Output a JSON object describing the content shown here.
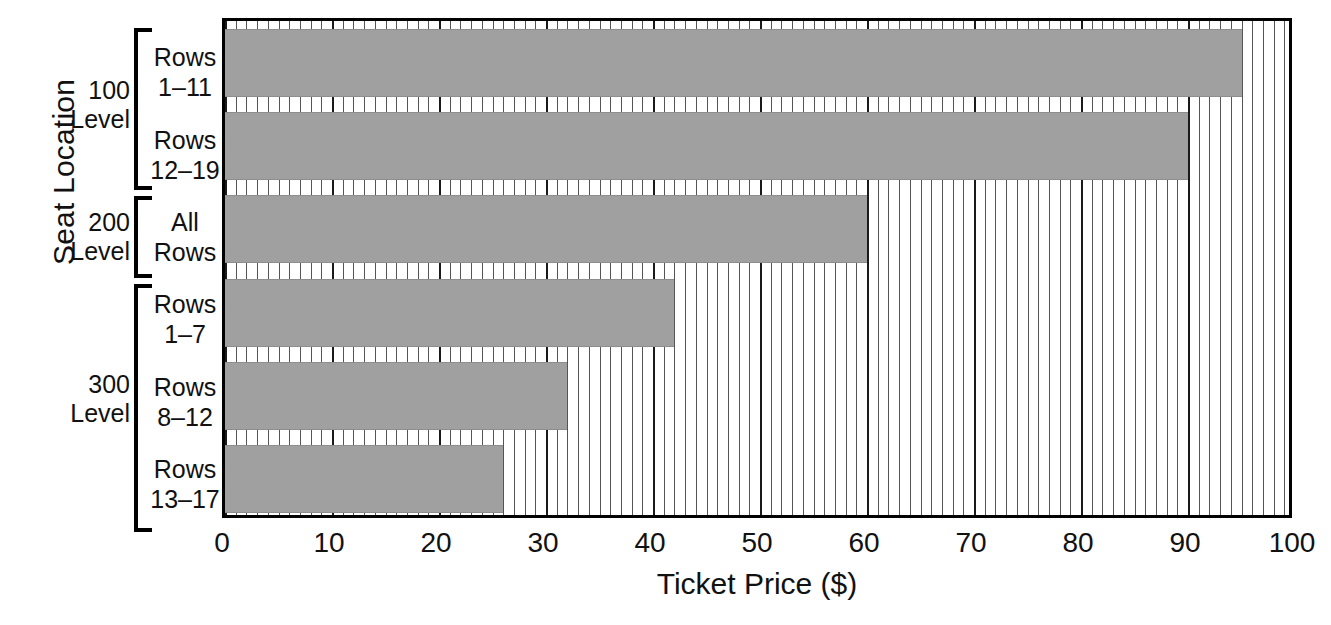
{
  "chart_data": {
    "type": "bar",
    "orientation": "horizontal",
    "title": "",
    "xlabel": "Ticket Price ($)",
    "ylabel": "Seat Location",
    "xlim": [
      0,
      100
    ],
    "xticks": [
      0,
      10,
      20,
      30,
      40,
      50,
      60,
      70,
      80,
      90,
      100
    ],
    "xtick_labels": [
      "0",
      "10",
      "20",
      "30",
      "40",
      "50",
      "60",
      "70",
      "80",
      "90",
      "100"
    ],
    "minor_tick_step": 1,
    "grid": "vertical-minor-and-major",
    "legend": "none",
    "bar_color": "#a0a0a0",
    "categories": [
      "Rows 1–11",
      "Rows 12–19",
      "All Rows",
      "Rows 1–7",
      "Rows 8–12",
      "Rows 13–17"
    ],
    "values": [
      95,
      90,
      60,
      42,
      32,
      26
    ],
    "groups": [
      {
        "label_line1": "100",
        "label_line2": "Level",
        "categories": [
          "Rows 1–11",
          "Rows 12–19"
        ]
      },
      {
        "label_line1": "200",
        "label_line2": "Level",
        "categories": [
          "All Rows"
        ]
      },
      {
        "label_line1": "300",
        "label_line2": "Level",
        "categories": [
          "Rows 1–7",
          "Rows 8–12",
          "Rows 13–17"
        ]
      }
    ]
  },
  "axes": {
    "y_title": "Seat Location",
    "x_title": "Ticket Price ($)"
  },
  "level_labels": [
    {
      "line1": "100",
      "line2": "Level"
    },
    {
      "line1": "200",
      "line2": "Level"
    },
    {
      "line1": "300",
      "line2": "Level"
    }
  ],
  "row_labels": [
    {
      "line1": "Rows",
      "line2": "1–11",
      "value": 95
    },
    {
      "line1": "Rows",
      "line2": "12–19",
      "value": 90
    },
    {
      "line1": "All",
      "line2": "Rows",
      "value": 60
    },
    {
      "line1": "Rows",
      "line2": "1–7",
      "value": 42
    },
    {
      "line1": "Rows",
      "line2": "8–12",
      "value": 32
    },
    {
      "line1": "Rows",
      "line2": "13–17",
      "value": 26
    }
  ],
  "xticks": [
    "0",
    "10",
    "20",
    "30",
    "40",
    "50",
    "60",
    "70",
    "80",
    "90",
    "100"
  ],
  "colors": {
    "bar_fill": "#a0a0a0",
    "axis": "#000000",
    "gridline_minor": "#555555",
    "gridline_major": "#1a1a1a",
    "background": "#ffffff"
  }
}
